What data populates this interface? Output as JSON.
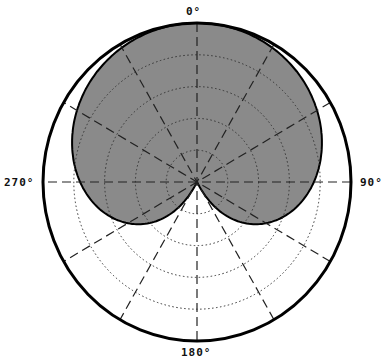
{
  "chart_data": {
    "type": "polar",
    "title": "",
    "angle_labels": [
      "0°",
      "90°",
      "180°",
      "270°"
    ],
    "angle_label_values": [
      0,
      90,
      180,
      270
    ],
    "radial_spoke_step_deg": 30,
    "ring_count": 5,
    "radial_range_db": [
      -25,
      0
    ],
    "grid": true,
    "fill_color": "#8a8a8a",
    "outline_color": "#000000",
    "series": [
      {
        "name": "cardioid pattern",
        "angles_deg": [
          0,
          15,
          30,
          45,
          60,
          75,
          90,
          105,
          120,
          135,
          150,
          165,
          180,
          195,
          210,
          225,
          240,
          255,
          270,
          285,
          300,
          315,
          330,
          345,
          360
        ],
        "values_db": [
          0,
          -0.1,
          -0.6,
          -1.4,
          -2.5,
          -4.0,
          -6.0,
          -8.6,
          -12.0,
          -16.7,
          -23.4,
          -25,
          -25,
          -25,
          -23.4,
          -16.7,
          -12.0,
          -8.6,
          -6.0,
          -4.0,
          -2.5,
          -1.4,
          -0.6,
          -0.1,
          0
        ]
      }
    ]
  }
}
